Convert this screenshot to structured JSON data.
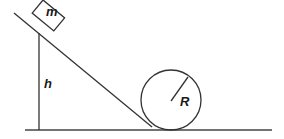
{
  "diagram": {
    "type": "physics-loop-the-loop",
    "labels": {
      "mass": "m",
      "height": "h",
      "radius": "R"
    },
    "elements": [
      "ground-line",
      "incline-ramp",
      "height-line",
      "block",
      "circular-loop",
      "radius-line"
    ],
    "colors": {
      "stroke": "#333333",
      "background": "#ffffff"
    }
  }
}
